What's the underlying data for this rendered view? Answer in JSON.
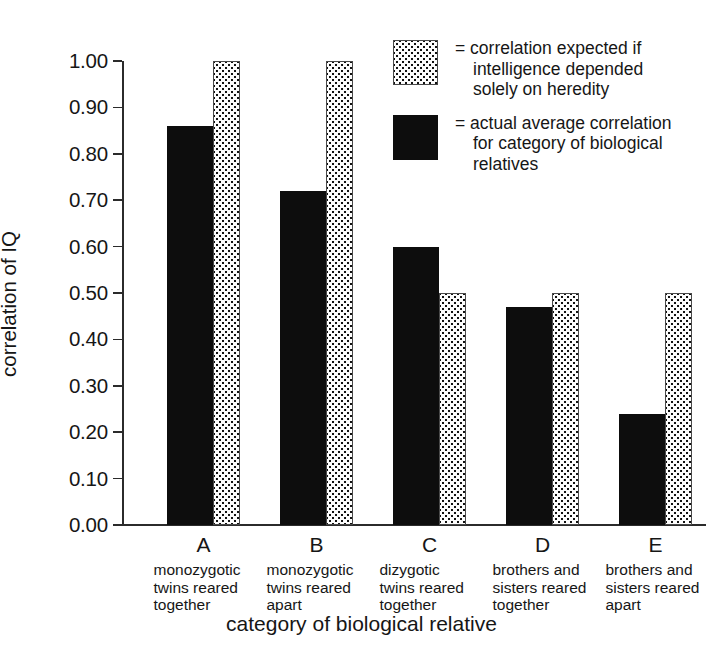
{
  "chart_data": {
    "type": "bar",
    "title": "",
    "xlabel": "category of biological relative",
    "ylabel": "correlation of IQ",
    "ylim": [
      0.0,
      1.0
    ],
    "grid": false,
    "legend_position": "top-right",
    "categories": [
      "A",
      "B",
      "C",
      "D",
      "E"
    ],
    "category_descriptions": [
      [
        "monozygotic",
        "twins reared",
        "together"
      ],
      [
        "monozygotic",
        "twins reared",
        "apart"
      ],
      [
        "dizygotic",
        "twins reared",
        "together"
      ],
      [
        "brothers and",
        "sisters reared",
        "together"
      ],
      [
        "brothers and",
        "sisters reared",
        "apart"
      ]
    ],
    "series": [
      {
        "name": "actual average correlation for category of biological relatives",
        "style": "solid-black",
        "values": [
          0.86,
          0.72,
          0.6,
          0.47,
          0.24
        ]
      },
      {
        "name": "correlation expected if intelligence depended solely on heredity",
        "style": "dotted-fill",
        "values": [
          1.0,
          1.0,
          0.5,
          0.5,
          0.5
        ]
      }
    ],
    "ytick_labels": [
      "1.00",
      "0.90",
      "0.80",
      "0.70",
      "0.60",
      "0.50",
      "0.40",
      "0.30",
      "0.20",
      "0.10",
      "0.00"
    ],
    "ytick_values": [
      1.0,
      0.9,
      0.8,
      0.7,
      0.6,
      0.5,
      0.4,
      0.3,
      0.2,
      0.1,
      0.0
    ],
    "colors": {
      "solid": "#0d0d0d",
      "dotted_fill": "#fdfdfd",
      "dotted_dots": "#111111",
      "axis": "#2b2b2b",
      "text": "#161616",
      "background": "#ffffff"
    }
  },
  "legend": {
    "entries": [
      {
        "equals": "=",
        "swatch": "dotted-fill",
        "lines": [
          "correlation expected if",
          "intelligence depended",
          "solely on heredity"
        ]
      },
      {
        "equals": "=",
        "swatch": "solid-black",
        "lines": [
          "actual average correlation",
          "for category of biological",
          "relatives"
        ]
      }
    ]
  },
  "axes": {
    "y_title": "correlation of IQ",
    "x_title": "category of biological relative"
  }
}
